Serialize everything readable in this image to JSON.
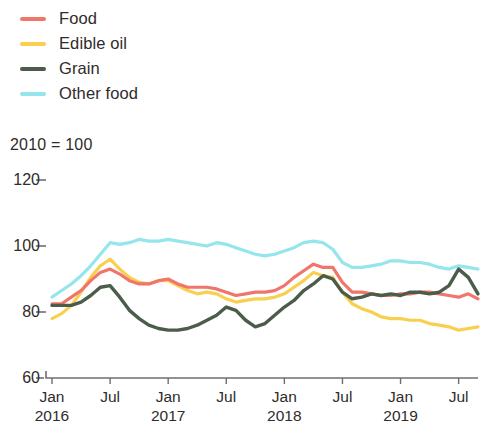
{
  "legend": {
    "items": [
      {
        "label": "Food",
        "color": "#f0756a",
        "icon": "line-swatch-icon"
      },
      {
        "label": "Edible oil",
        "color": "#f9cf4e",
        "icon": "line-swatch-icon"
      },
      {
        "label": "Grain",
        "color": "#4c5c4a",
        "icon": "line-swatch-icon"
      },
      {
        "label": "Other food",
        "color": "#95e6ec",
        "icon": "line-swatch-icon"
      }
    ]
  },
  "subtitle": "2010 = 100",
  "chart_data": {
    "type": "line",
    "title": "",
    "subtitle": "2010 = 100",
    "xlabel": "",
    "ylabel": "",
    "ylim": [
      60,
      120
    ],
    "yticks": [
      60,
      80,
      100,
      120
    ],
    "ytick_labels": [
      "60",
      "80",
      "100",
      "120"
    ],
    "grid": false,
    "legend_position": "top-left",
    "x": [
      "Jan 2016",
      "Feb 2016",
      "Mar 2016",
      "Apr 2016",
      "May 2016",
      "Jun 2016",
      "Jul 2016",
      "Aug 2016",
      "Sep 2016",
      "Oct 2016",
      "Nov 2016",
      "Dec 2016",
      "Jan 2017",
      "Feb 2017",
      "Mar 2017",
      "Apr 2017",
      "May 2017",
      "Jun 2017",
      "Jul 2017",
      "Aug 2017",
      "Sep 2017",
      "Oct 2017",
      "Nov 2017",
      "Dec 2017",
      "Jan 2018",
      "Feb 2018",
      "Mar 2018",
      "Apr 2018",
      "May 2018",
      "Jun 2018",
      "Jul 2018",
      "Aug 2018",
      "Sep 2018",
      "Oct 2018",
      "Nov 2018",
      "Dec 2018",
      "Jan 2019",
      "Feb 2019",
      "Mar 2019",
      "Apr 2019",
      "May 2019",
      "Jun 2019",
      "Jul 2019",
      "Aug 2019",
      "Sep 2019"
    ],
    "xtick_labels": [
      {
        "month": "Jan",
        "year": "2016"
      },
      {
        "month": "Jul",
        "year": ""
      },
      {
        "month": "Jan",
        "year": "2017"
      },
      {
        "month": "Jul",
        "year": ""
      },
      {
        "month": "Jan",
        "year": "2018"
      },
      {
        "month": "Jul",
        "year": ""
      },
      {
        "month": "Jan",
        "year": "2019"
      },
      {
        "month": "Jul",
        "year": ""
      }
    ],
    "xtick_indices": [
      0,
      6,
      12,
      18,
      24,
      30,
      36,
      42
    ],
    "series": [
      {
        "name": "Food",
        "color": "#f0756a",
        "values": [
          82.5,
          82.5,
          84.5,
          86.5,
          89.5,
          92.0,
          93.0,
          91.5,
          89.5,
          88.5,
          88.5,
          89.5,
          90.0,
          88.5,
          87.5,
          87.5,
          87.5,
          87.0,
          86.0,
          85.0,
          85.5,
          86.0,
          86.0,
          86.5,
          88.0,
          90.5,
          92.5,
          94.5,
          93.5,
          93.5,
          89.0,
          86.0,
          86.0,
          85.5,
          85.0,
          85.0,
          85.5,
          85.5,
          86.0,
          86.0,
          85.5,
          85.0,
          84.5,
          85.5,
          84.0
        ]
      },
      {
        "name": "Edible oil",
        "color": "#f9cf4e",
        "values": [
          78.0,
          79.5,
          82.0,
          86.0,
          90.5,
          94.0,
          96.0,
          93.0,
          90.5,
          89.0,
          88.5,
          89.5,
          89.5,
          88.0,
          86.5,
          85.5,
          86.0,
          85.5,
          84.0,
          83.0,
          83.5,
          84.0,
          84.0,
          84.5,
          85.5,
          87.5,
          89.5,
          92.0,
          91.0,
          90.5,
          86.0,
          82.5,
          81.0,
          80.0,
          78.5,
          78.0,
          78.0,
          77.5,
          77.5,
          76.5,
          76.0,
          75.5,
          74.5,
          75.0,
          75.5
        ]
      },
      {
        "name": "Grain",
        "color": "#4c5c4a",
        "values": [
          82.0,
          82.0,
          82.0,
          83.0,
          85.0,
          87.5,
          88.0,
          84.5,
          80.5,
          78.0,
          76.0,
          75.0,
          74.5,
          74.5,
          75.0,
          76.0,
          77.5,
          79.0,
          81.5,
          80.5,
          77.5,
          75.5,
          76.5,
          79.0,
          81.5,
          83.5,
          86.5,
          88.5,
          91.0,
          90.0,
          86.0,
          84.0,
          84.5,
          85.5,
          85.0,
          85.5,
          85.0,
          86.0,
          86.0,
          85.5,
          86.0,
          88.0,
          93.0,
          90.5,
          85.5
        ]
      },
      {
        "name": "Other food",
        "color": "#95e6ec",
        "values": [
          84.5,
          86.5,
          88.5,
          91.0,
          94.0,
          97.5,
          101.0,
          100.5,
          101.0,
          102.0,
          101.5,
          101.5,
          102.0,
          101.5,
          101.0,
          100.5,
          100.0,
          101.0,
          100.5,
          99.5,
          98.5,
          97.5,
          97.0,
          97.5,
          98.5,
          99.5,
          101.0,
          101.5,
          101.0,
          99.0,
          95.0,
          93.5,
          93.5,
          94.0,
          94.5,
          95.5,
          95.5,
          95.0,
          95.0,
          94.5,
          93.5,
          93.0,
          94.0,
          93.5,
          93.0
        ]
      }
    ]
  }
}
